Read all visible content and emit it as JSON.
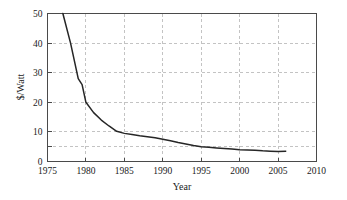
{
  "chart_data": {
    "type": "line",
    "title": "",
    "xlabel": "Year",
    "ylabel": "$/Watt",
    "xlim": [
      1975,
      2010
    ],
    "ylim": [
      0,
      50
    ],
    "grid": true,
    "legend": "none",
    "x_ticks": [
      "1975",
      "1980",
      "1985",
      "1990",
      "1995",
      "2000",
      "2005",
      "2010"
    ],
    "x_tick_values": [
      1975,
      1980,
      1985,
      1990,
      1995,
      2000,
      2005,
      2010
    ],
    "y_ticks": [
      "0",
      "10",
      "20",
      "30",
      "40",
      "50"
    ],
    "y_tick_values": [
      0,
      10,
      20,
      30,
      40,
      50
    ],
    "y_minor_tick_values": [
      5
    ],
    "line_color": "#262626",
    "grid_color": "#b4b4b4",
    "frame_color": "#4a4a4a",
    "background_color": "#ffffff",
    "series": [
      {
        "name": "Photovoltaic module price",
        "x": [
          1977,
          1978,
          1979,
          1979.5,
          1980,
          1981,
          1982,
          1983,
          1984,
          1985,
          1986,
          1987,
          1988,
          1989,
          1990,
          1991,
          1992,
          1993,
          1994,
          1995,
          1996,
          1997,
          1998,
          1999,
          2000,
          2001,
          2002,
          2003,
          2004,
          2005,
          2006
        ],
        "values": [
          50.0,
          40.0,
          28.0,
          26.0,
          20.0,
          16.5,
          14.0,
          12.0,
          10.2,
          9.5,
          9.1,
          8.7,
          8.4,
          8.0,
          7.5,
          7.0,
          6.4,
          5.9,
          5.4,
          5.0,
          4.8,
          4.6,
          4.4,
          4.2,
          4.0,
          3.9,
          3.8,
          3.6,
          3.5,
          3.4,
          3.5
        ]
      }
    ]
  }
}
